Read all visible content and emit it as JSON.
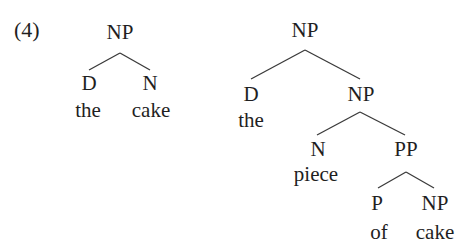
{
  "example_number": "(4)",
  "trees": [
    {
      "name": "the cake",
      "nodes": {
        "np": "NP",
        "d": "D",
        "n": "N",
        "the": "the",
        "cake": "cake"
      }
    },
    {
      "name": "the piece of cake",
      "nodes": {
        "np_top": "NP",
        "d": "D",
        "the": "the",
        "np_mid": "NP",
        "n": "N",
        "piece": "piece",
        "pp": "PP",
        "p": "P",
        "of": "of",
        "np_low": "NP",
        "cake": "cake"
      }
    }
  ],
  "colors": {
    "text": "#1f1f1f",
    "lines": "#3a3a3a",
    "background": "#ffffff"
  }
}
